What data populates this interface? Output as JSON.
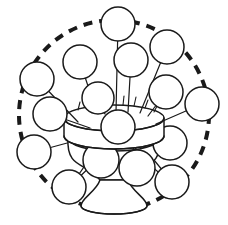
{
  "figure": {
    "title": "Flowers in a vase",
    "width": 228,
    "height": 225,
    "background_color": "#ffffff",
    "ink_color": "#1a1a1a"
  },
  "boundary": {
    "name": "dashed-circle",
    "shape": "circle",
    "center_x": 114,
    "center_y": 115,
    "radius": 95,
    "stroke_width": 4,
    "dash_on": 9,
    "dash_off": 7,
    "color": "#1a1a1a"
  },
  "vase": {
    "name": "flower-vase",
    "mouth_center_x": 114,
    "mouth_center_y": 118,
    "mouth_radius_x": 50,
    "mouth_radius_y": 13,
    "rim_band_height": 18,
    "foot_center_y": 206,
    "foot_radius_x": 33,
    "foot_radius_y": 8,
    "neck_half_width": 14,
    "color": "#ffffff",
    "outline_color": "#1a1a1a"
  },
  "center_bloom": {
    "name": "center-bloom",
    "cx": 118,
    "cy": 127,
    "r": 17
  },
  "blooms": [
    {
      "id": "bloom-top",
      "cx": 118,
      "cy": 24,
      "r": 17,
      "stem_to_x": 116,
      "stem_to_y": 112
    },
    {
      "id": "bloom-upper-left",
      "cx": 80,
      "cy": 62,
      "r": 17,
      "stem_to_x": 97,
      "stem_to_y": 113
    },
    {
      "id": "bloom-upper-right",
      "cx": 131,
      "cy": 60,
      "r": 17,
      "stem_to_x": 128,
      "stem_to_y": 112
    },
    {
      "id": "bloom-top-right",
      "cx": 167,
      "cy": 47,
      "r": 17,
      "stem_to_x": 140,
      "stem_to_y": 113
    },
    {
      "id": "bloom-left-upper",
      "cx": 37,
      "cy": 79,
      "r": 17,
      "stem_to_x": 78,
      "stem_to_y": 122
    },
    {
      "id": "bloom-inner-left",
      "cx": 98,
      "cy": 98,
      "r": 16,
      "stem_to_x": 105,
      "stem_to_y": 114
    },
    {
      "id": "bloom-right-upper",
      "cx": 166,
      "cy": 92,
      "r": 17,
      "stem_to_x": 148,
      "stem_to_y": 116
    },
    {
      "id": "bloom-left-mid",
      "cx": 50,
      "cy": 114,
      "r": 17,
      "stem_to_x": 90,
      "stem_to_y": 128
    },
    {
      "id": "bloom-far-right",
      "cx": 202,
      "cy": 104,
      "r": 17,
      "stem_to_x": 156,
      "stem_to_y": 124
    },
    {
      "id": "bloom-left-lower",
      "cx": 34,
      "cy": 152,
      "r": 17,
      "stem_to_x": 104,
      "stem_to_y": 133
    },
    {
      "id": "bloom-right-mid",
      "cx": 170,
      "cy": 143,
      "r": 17,
      "stem_to_x": 140,
      "stem_to_y": 131
    },
    {
      "id": "bloom-inner-lower",
      "cx": 101,
      "cy": 160,
      "r": 18,
      "stem_to_x": 103,
      "stem_to_y": 134
    },
    {
      "id": "bloom-lower-center",
      "cx": 137,
      "cy": 168,
      "r": 18,
      "stem_to_x": 131,
      "stem_to_y": 134
    },
    {
      "id": "bloom-lower-left",
      "cx": 69,
      "cy": 187,
      "r": 17,
      "stem_to_x": 122,
      "stem_to_y": 136
    },
    {
      "id": "bloom-lower-right",
      "cx": 172,
      "cy": 182,
      "r": 17,
      "stem_to_x": 136,
      "stem_to_y": 138
    }
  ],
  "rim_ticks": [
    {
      "id": "tick-1",
      "x1": 78,
      "y1": 110,
      "x2": 80,
      "y2": 102
    },
    {
      "id": "tick-2",
      "x1": 89,
      "y1": 107,
      "x2": 90,
      "y2": 99
    },
    {
      "id": "tick-3",
      "x1": 100,
      "y1": 106,
      "x2": 100,
      "y2": 97
    },
    {
      "id": "tick-4",
      "x1": 111,
      "y1": 105,
      "x2": 111,
      "y2": 96
    },
    {
      "id": "tick-5",
      "x1": 123,
      "y1": 105,
      "x2": 124,
      "y2": 96
    },
    {
      "id": "tick-6",
      "x1": 134,
      "y1": 106,
      "x2": 136,
      "y2": 97
    },
    {
      "id": "tick-7",
      "x1": 145,
      "y1": 108,
      "x2": 148,
      "y2": 100
    },
    {
      "id": "tick-8",
      "x1": 154,
      "y1": 112,
      "x2": 158,
      "y2": 104
    }
  ],
  "lower_stems": [
    {
      "id": "lower-stem-a",
      "path": "M 104 134 C 96 150, 84 168, 70 186"
    },
    {
      "id": "lower-stem-b",
      "path": "M 118 136 C 116 154, 112 170, 104 186"
    },
    {
      "id": "lower-stem-c",
      "path": "M 128 136 C 136 152, 150 166, 163 176"
    }
  ]
}
